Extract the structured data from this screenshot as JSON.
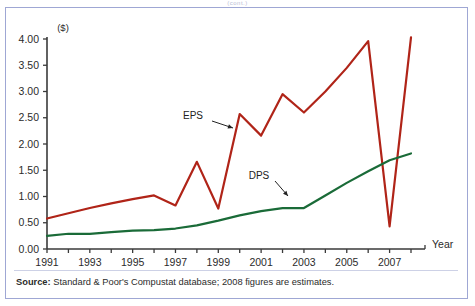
{
  "figure": {
    "top_clipped_text": "(cont.)",
    "unit_label": "($)",
    "x_axis_name": "Year",
    "source_bold": "Source:",
    "source_text": " Standard & Poor's Compustat database; 2008 figures are estimates."
  },
  "colors": {
    "eps_line": "#b02418",
    "dps_line": "#1a6b38",
    "axis": "#3a3a3a",
    "frame": "#9fa7d4",
    "text": "#2b2b2b"
  },
  "chart_data": {
    "type": "line",
    "title": "",
    "subtitle": "",
    "xlabel": "Year",
    "ylabel": "($)",
    "ylim": [
      0.0,
      4.0
    ],
    "xlim": [
      1991,
      2008
    ],
    "grid": false,
    "legend_position": "inline-annotations",
    "y_ticks": [
      "0.00",
      "0.50",
      "1.00",
      "1.50",
      "2.00",
      "2.50",
      "3.00",
      "3.50",
      "4.00"
    ],
    "y_tick_values": [
      0.0,
      0.5,
      1.0,
      1.5,
      2.0,
      2.5,
      3.0,
      3.5,
      4.0
    ],
    "x_ticks_all": [
      1991,
      1992,
      1993,
      1994,
      1995,
      1996,
      1997,
      1998,
      1999,
      2000,
      2001,
      2002,
      2003,
      2004,
      2005,
      2006,
      2007,
      2008
    ],
    "x_tick_labels": [
      "1991",
      "1993",
      "1995",
      "1997",
      "1999",
      "2001",
      "2003",
      "2005",
      "2007"
    ],
    "x_tick_label_values": [
      1991,
      1993,
      1995,
      1997,
      1999,
      2001,
      2003,
      2005,
      2007
    ],
    "x": [
      1991,
      1992,
      1993,
      1994,
      1995,
      1996,
      1997,
      1998,
      1999,
      2000,
      2001,
      2002,
      2003,
      2004,
      2005,
      2006,
      2007,
      2008
    ],
    "series": [
      {
        "name": "EPS",
        "color": "#b02418",
        "annotation": "EPS",
        "values": [
          0.58,
          0.68,
          0.78,
          0.87,
          0.95,
          1.02,
          0.83,
          1.66,
          0.77,
          2.57,
          2.16,
          2.95,
          2.6,
          3.0,
          3.45,
          3.96,
          0.43,
          4.03
        ]
      },
      {
        "name": "DPS",
        "color": "#1a6b38",
        "annotation": "DPS",
        "values": [
          0.25,
          0.29,
          0.29,
          0.32,
          0.35,
          0.36,
          0.39,
          0.45,
          0.54,
          0.64,
          0.72,
          0.78,
          0.78,
          1.02,
          1.26,
          1.48,
          1.69,
          1.82
        ]
      }
    ],
    "annotations": [
      {
        "label": "EPS",
        "x_px": 193,
        "y_px": 119
      },
      {
        "label": "DPS",
        "x_px": 259,
        "y_px": 179
      }
    ]
  }
}
